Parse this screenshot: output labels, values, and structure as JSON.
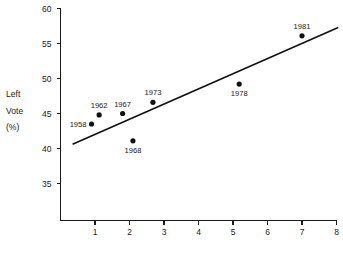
{
  "chart_data": {
    "type": "scatter",
    "title": "",
    "xlabel": "",
    "ylabel": "Left Vote (%)",
    "ylabel_lines": [
      "Left",
      "Vote",
      "(%)"
    ],
    "xlim": [
      0,
      8.2
    ],
    "ylim": [
      32.5,
      60
    ],
    "grid": false,
    "legend": "none",
    "x_ticks": [
      1,
      2,
      3,
      4,
      5,
      6,
      7,
      8
    ],
    "x_tick_labels": [
      "1",
      "2",
      "3",
      "4",
      "5",
      "6",
      "7",
      "8"
    ],
    "y_ticks": [
      35,
      40,
      45,
      50,
      55,
      60
    ],
    "y_tick_labels": [
      "35",
      "40",
      "45",
      "50",
      "55",
      "60"
    ],
    "points": [
      {
        "label": "1958",
        "x": 0.9,
        "y": 43.5,
        "label_pos": "left"
      },
      {
        "label": "1962",
        "x": 1.12,
        "y": 44.8,
        "label_pos": "above"
      },
      {
        "label": "1967",
        "x": 1.8,
        "y": 45.0,
        "label_pos": "above"
      },
      {
        "label": "1968",
        "x": 2.1,
        "y": 41.1,
        "label_pos": "below"
      },
      {
        "label": "1973",
        "x": 2.68,
        "y": 46.6,
        "label_pos": "above"
      },
      {
        "label": "1978",
        "x": 5.18,
        "y": 49.2,
        "label_pos": "below"
      },
      {
        "label": "1981",
        "x": 7.0,
        "y": 56.1,
        "label_pos": "above"
      }
    ],
    "fit_line": {
      "name": "regression-line",
      "x1": 0.35,
      "y1": 40.6,
      "x2": 8.05,
      "y2": 57.3
    },
    "colors": {
      "axis": "#1a1a1a",
      "marker": "#111111",
      "line": "#111111",
      "text": "#1a1a1a",
      "background": "#ffffff"
    }
  }
}
